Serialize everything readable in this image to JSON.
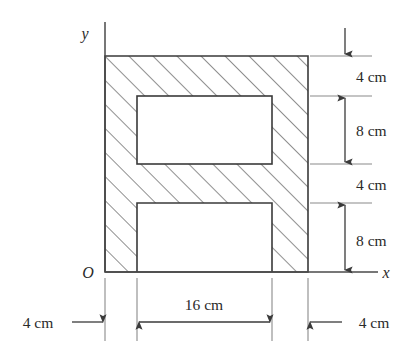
{
  "figure": {
    "background_color": "#ffffff",
    "line_color": "#3a3a3a",
    "hatch_color": "#6b6b6b",
    "text_color": "#2a2a2a"
  },
  "axes": {
    "origin_label": "O",
    "x_label": "x",
    "y_label": "y"
  },
  "dimensions": {
    "vertical": [
      {
        "id": "top-flange",
        "label": "4 cm",
        "value": 4,
        "unit": "cm"
      },
      {
        "id": "upper-opening",
        "label": "8 cm",
        "value": 8,
        "unit": "cm"
      },
      {
        "id": "web",
        "label": "4 cm",
        "value": 4,
        "unit": "cm"
      },
      {
        "id": "lower-opening",
        "label": "8 cm",
        "value": 8,
        "unit": "cm"
      }
    ],
    "horizontal": [
      {
        "id": "left-wall",
        "label": "4 cm",
        "value": 4,
        "unit": "cm"
      },
      {
        "id": "opening-width",
        "label": "16 cm",
        "value": 16,
        "unit": "cm"
      },
      {
        "id": "right-wall",
        "label": "4 cm",
        "value": 4,
        "unit": "cm"
      }
    ]
  },
  "geometry": {
    "outer_width_cm": 24,
    "outer_height_cm": 24,
    "note": "Shaded region is the cross-section; white rectangles are voids"
  }
}
